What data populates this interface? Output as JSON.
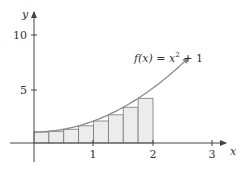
{
  "chart_data": {
    "type": "line",
    "title": "",
    "xlabel": "x",
    "ylabel": "y",
    "xlim": [
      -0.5,
      3.3
    ],
    "ylim": [
      -3,
      12
    ],
    "grid": false,
    "x_ticks": [
      1,
      2,
      3
    ],
    "x_tick_labels": [
      "1",
      "2",
      "3"
    ],
    "y_ticks": [
      5,
      10
    ],
    "y_tick_labels": [
      "5",
      "10"
    ],
    "series": [
      {
        "name": "f(x) = x^2 + 1",
        "function": "x^2 + 1",
        "x_range": [
          0,
          2.6
        ],
        "color": "#8a8a8a",
        "arrow_end": true
      }
    ],
    "rectangles": {
      "type": "left-endpoint Riemann sum",
      "interval": [
        0,
        2
      ],
      "n": 8,
      "width": 0.25,
      "x_left": [
        0,
        0.25,
        0.5,
        0.75,
        1.0,
        1.25,
        1.5,
        1.75
      ],
      "heights": [
        1.0,
        1.0625,
        1.25,
        1.5625,
        2.0,
        2.5625,
        3.25,
        4.0625
      ],
      "fill": "#ececec",
      "stroke": "#777777"
    },
    "annotations": [
      {
        "text": "f(x) = x² + 1",
        "x": 1.95,
        "y": 8.6
      }
    ],
    "legend": null
  },
  "labels": {
    "x_axis": "x",
    "y_axis": "y",
    "tick_1": "1",
    "tick_2": "2",
    "tick_3": "3",
    "tick_5": "5",
    "tick_10": "10",
    "fn_prefix": "f(x) = x",
    "fn_exp": "2",
    "fn_suffix": " + 1"
  }
}
